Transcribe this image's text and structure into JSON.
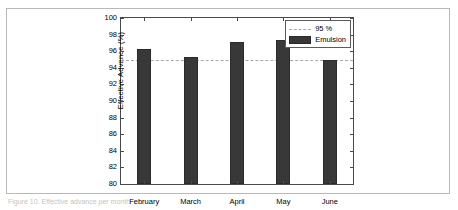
{
  "figure": {
    "caption": "Figure 10.  Effective advance per month"
  },
  "chart_data": {
    "type": "bar",
    "title": "",
    "xlabel": "",
    "ylabel": "Effective Advance (%)",
    "categories": [
      "February",
      "March",
      "April",
      "May",
      "June"
    ],
    "series": [
      {
        "name": "Emulsion",
        "values": [
          96.3,
          95.3,
          97.1,
          97.3,
          94.9
        ],
        "color": "#383838"
      }
    ],
    "ylim": [
      80,
      100
    ],
    "yticks": [
      80,
      82,
      84,
      86,
      88,
      90,
      92,
      94,
      96,
      98,
      100
    ],
    "ytick_labels": [
      "80",
      "82",
      "84",
      "86",
      "88",
      "90",
      "92",
      "94",
      "96",
      "98",
      "100"
    ],
    "grid": false,
    "reference_line": {
      "label": "95 %",
      "value": 95,
      "style": "dashed",
      "color": "#a8a8a8"
    },
    "legend": {
      "position": "top-right",
      "entries": [
        {
          "label": "95 %",
          "marker": "dashed-line"
        },
        {
          "label": "Emulsion",
          "marker": "filled-patch"
        }
      ]
    }
  }
}
